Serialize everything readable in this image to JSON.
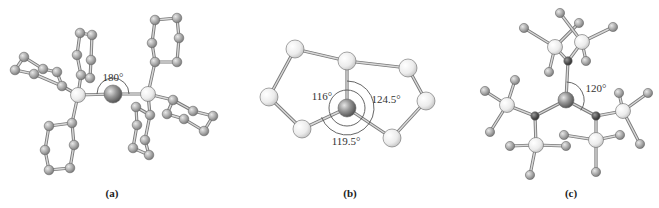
{
  "figure": {
    "panels": [
      {
        "id": "a",
        "label": "(a)",
        "label_pos": [
          112,
          196
        ],
        "description": "Linear two-coordinate metal center bonded to two triphenylphosphine-like ligands",
        "angles": [
          {
            "text": "180°",
            "pos": [
              113,
              78
            ],
            "arc": {
              "cx": 113,
              "cy": 94,
              "r": 16,
              "start": 180,
              "end": 360
            }
          }
        ],
        "central_atoms": [
          {
            "role": "metal",
            "x": 113,
            "y": 94,
            "r": 9,
            "color": "#8c8c8c"
          }
        ],
        "donor_atoms": [
          {
            "role": "P",
            "x": 78,
            "y": 95,
            "r": 7.5,
            "color": "#f2f2f2"
          },
          {
            "role": "P",
            "x": 148,
            "y": 94,
            "r": 7.5,
            "color": "#f2f2f2"
          }
        ],
        "ring_atom_color": "#a8a8a8",
        "ring_atom_r": 4.8,
        "rings": [
          {
            "attach": 0,
            "ipso": [
              81,
              75
            ],
            "atoms": [
              [
                81,
                75
              ],
              [
                77,
                55
              ],
              [
                80,
                33
              ],
              [
                92,
                35
              ],
              [
                91,
                60
              ],
              [
                90,
                78
              ]
            ],
            "closed": true
          },
          {
            "attach": 0,
            "ipso": [
              62,
              86
            ],
            "atoms": [
              [
                62,
                86
              ],
              [
                57,
                72
              ],
              [
                43,
                69
              ],
              [
                24,
                57
              ],
              [
                15,
                70
              ],
              [
                34,
                74
              ]
            ],
            "closed": true
          },
          {
            "attach": 0,
            "ipso": [
              72,
              123
            ],
            "atoms": [
              [
                72,
                123
              ],
              [
                74,
                145
              ],
              [
                70,
                168
              ],
              [
                49,
                170
              ],
              [
                45,
                150
              ],
              [
                49,
                126
              ]
            ],
            "closed": true
          },
          {
            "attach": 1,
            "ipso": [
              155,
              62
            ],
            "atoms": [
              [
                155,
                62
              ],
              [
                152,
                43
              ],
              [
                155,
                20
              ],
              [
                177,
                18
              ],
              [
                179,
                38
              ],
              [
                177,
                62
              ]
            ],
            "closed": true
          },
          {
            "attach": 1,
            "ipso": [
              173,
              100
            ],
            "atoms": [
              [
                173,
                100
              ],
              [
                193,
                111
              ],
              [
                213,
                116
              ],
              [
                204,
                131
              ],
              [
                184,
                119
              ],
              [
                167,
                114
              ]
            ],
            "closed": true
          },
          {
            "attach": 1,
            "ipso": [
              150,
              115
            ],
            "atoms": [
              [
                150,
                115
              ],
              [
                145,
                140
              ],
              [
                149,
                155
              ],
              [
                133,
                148
              ],
              [
                137,
                125
              ],
              [
                136,
                107
              ]
            ],
            "closed": true
          }
        ]
      },
      {
        "id": "b",
        "label": "(b)",
        "label_pos": [
          350,
          196
        ],
        "description": "Three-coordinate metal center with three donor atoms in a ring-chelating framework",
        "angles": [
          {
            "text": "116°",
            "pos": [
              322,
              100
            ]
          },
          {
            "text": "124.5°",
            "pos": [
              384,
              103
            ]
          },
          {
            "text": "119.5°",
            "pos": [
              345,
              145
            ]
          }
        ],
        "arc_inner": {
          "cx": 347,
          "cy": 108,
          "r": 18
        },
        "arc_outer": {
          "cx": 347,
          "cy": 108,
          "r": 27
        },
        "central_atoms": [
          {
            "role": "metal",
            "x": 347,
            "y": 108,
            "r": 9,
            "color": "#8c8c8c"
          }
        ],
        "ring_atom_color": "#ececec",
        "ring_atom_r": 9,
        "atoms": [
          {
            "id": "tl",
            "x": 295,
            "y": 49
          },
          {
            "id": "tc",
            "x": 347,
            "y": 61
          },
          {
            "id": "tr",
            "x": 408,
            "y": 68
          },
          {
            "id": "l",
            "x": 269,
            "y": 97
          },
          {
            "id": "r",
            "x": 426,
            "y": 101
          },
          {
            "id": "bl",
            "x": 302,
            "y": 129
          },
          {
            "id": "br",
            "x": 392,
            "y": 138
          }
        ],
        "bonds": [
          [
            "tl",
            "tc"
          ],
          [
            "tc",
            "tr"
          ],
          [
            "tl",
            "l"
          ],
          [
            "l",
            "bl"
          ],
          [
            "tr",
            "r"
          ],
          [
            "r",
            "br"
          ],
          [
            "tc",
            "M"
          ],
          [
            "bl",
            "M"
          ],
          [
            "br",
            "M"
          ]
        ]
      },
      {
        "id": "c",
        "label": "(c)",
        "label_pos": [
          571,
          196
        ],
        "description": "Trigonal-planar metal center bound to three N(SiMe3)2 ligands",
        "angles": [
          {
            "text": "120°",
            "pos": [
              595,
              92
            ],
            "arc": {
              "cx": 566,
              "cy": 100,
              "r": 18
            }
          }
        ],
        "central_atoms": [
          {
            "role": "metal",
            "x": 566,
            "y": 100,
            "r": 8,
            "color": "#8c8c8c"
          }
        ],
        "nitrogen_color": "#4a4a4a",
        "silicon_color": "#f0f0f0",
        "methyl_color": "#a8a8a8",
        "nitrogens": [
          {
            "id": "N1",
            "x": 568,
            "y": 61
          },
          {
            "id": "N2",
            "x": 535,
            "y": 116
          },
          {
            "id": "N3",
            "x": 596,
            "y": 116
          }
        ],
        "silicons": [
          {
            "id": "Si1",
            "N": "N1",
            "x": 555,
            "y": 47,
            "methyls": [
              [
                524,
                28
              ],
              [
                579,
                23
              ],
              [
                549,
                72
              ]
            ]
          },
          {
            "id": "Si2",
            "N": "N1",
            "x": 582,
            "y": 42,
            "methyls": [
              [
                560,
                13
              ],
              [
                613,
                27
              ],
              [
                586,
                61
              ]
            ]
          },
          {
            "id": "Si3",
            "N": "N2",
            "x": 507,
            "y": 105,
            "methyls": [
              [
                485,
                91
              ],
              [
                515,
                80
              ],
              [
                490,
                132
              ]
            ]
          },
          {
            "id": "Si4",
            "N": "N2",
            "x": 536,
            "y": 145,
            "methyls": [
              [
                510,
                146
              ],
              [
                566,
                146
              ],
              [
                530,
                175
              ]
            ]
          },
          {
            "id": "Si5",
            "N": "N3",
            "x": 623,
            "y": 111,
            "methyls": [
              [
                619,
                93
              ],
              [
                648,
                93
              ],
              [
                640,
                144
              ]
            ]
          },
          {
            "id": "Si6",
            "N": "N3",
            "x": 596,
            "y": 140,
            "methyls": [
              [
                564,
                135
              ],
              [
                620,
                135
              ],
              [
                596,
                172
              ]
            ]
          }
        ]
      }
    ]
  }
}
